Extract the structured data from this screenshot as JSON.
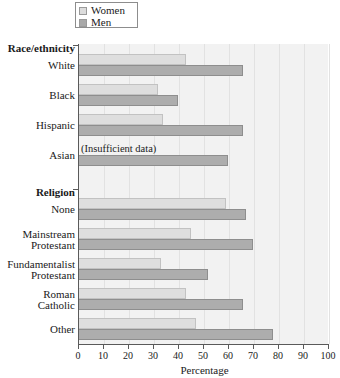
{
  "chart_data": {
    "type": "bar",
    "orientation": "horizontal",
    "title": "",
    "xlabel": "Percentage",
    "ylabel": "",
    "xlim": [
      0,
      100
    ],
    "grid": true,
    "legend_position": "top-left",
    "xticks": [
      0,
      10,
      20,
      30,
      40,
      50,
      60,
      70,
      80,
      90,
      100
    ],
    "legend": [
      {
        "name": "Women",
        "color": "#dedede"
      },
      {
        "name": "Men",
        "color": "#adadad"
      }
    ],
    "series": [
      {
        "name": "Women",
        "color": "#dedede"
      },
      {
        "name": "Men",
        "color": "#adadad"
      }
    ],
    "groups": [
      {
        "title": "Race/ethnicity",
        "categories": [
          {
            "label": "White",
            "label2": "",
            "women": 43,
            "men": 66,
            "note": ""
          },
          {
            "label": "Black",
            "label2": "",
            "women": 32,
            "men": 40,
            "note": ""
          },
          {
            "label": "Hispanic",
            "label2": "",
            "women": 34,
            "men": 66,
            "note": ""
          },
          {
            "label": "Asian",
            "label2": "",
            "women": null,
            "men": 60,
            "note": "(Insufficient data)"
          }
        ]
      },
      {
        "title": "Religion",
        "categories": [
          {
            "label": "None",
            "label2": "",
            "women": 59,
            "men": 67,
            "note": ""
          },
          {
            "label": "Mainstream",
            "label2": "Protestant",
            "women": 45,
            "men": 70,
            "note": ""
          },
          {
            "label": "Fundamentalist",
            "label2": "Protestant",
            "women": 33,
            "men": 52,
            "note": ""
          },
          {
            "label": "Roman",
            "label2": "Catholic",
            "women": 43,
            "men": 66,
            "note": ""
          },
          {
            "label": "Other",
            "label2": "",
            "women": 47,
            "men": 78,
            "note": ""
          }
        ]
      }
    ]
  },
  "colors": {
    "women": "#dedede",
    "men": "#adadad",
    "plot_background": "#f2f2f2",
    "axis": "#5a5a5a",
    "gridline": "#e2e2e2"
  }
}
